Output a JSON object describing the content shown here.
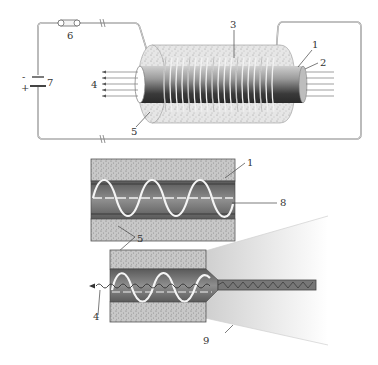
{
  "figure": {
    "top_panel": {
      "description": "Solenoid coil wound around fiber in ferrofluid/medium, driven by DC source",
      "labels": [
        {
          "id": "1",
          "text": "1"
        },
        {
          "id": "2",
          "text": "2"
        },
        {
          "id": "3",
          "text": "3"
        },
        {
          "id": "4",
          "text": "4"
        },
        {
          "id": "5",
          "text": "5"
        },
        {
          "id": "6",
          "text": "6"
        },
        {
          "id": "7",
          "text": "7"
        }
      ],
      "battery_signs": {
        "minus": "-",
        "plus": "+"
      }
    },
    "middle_panel": {
      "description": "Longitudinal cross-section of fiber with sinusoidal coil wave",
      "labels": [
        {
          "id": "1",
          "text": "1"
        },
        {
          "id": "8",
          "text": "8"
        },
        {
          "id": "5",
          "text": "5"
        }
      ]
    },
    "bottom_panel": {
      "description": "Tapered fiber section with output light cone",
      "labels": [
        {
          "id": "4",
          "text": "4"
        },
        {
          "id": "9",
          "text": "9"
        }
      ]
    },
    "colors": {
      "stipple_fill": "#cfcfcf",
      "core_dark": "#4a4a4a",
      "core_mid": "#8a8a8a",
      "wire": "#888888",
      "label": "#333333"
    }
  }
}
